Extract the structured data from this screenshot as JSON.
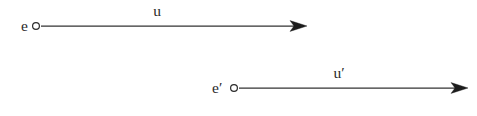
{
  "figure": {
    "type": "vector-diagram",
    "background_color": "#ffffff",
    "line_color": "#333333",
    "label_color": "#2a2a2a",
    "arrows": [
      {
        "id": "arrow-u",
        "origin_label": "e",
        "vector_label": "u",
        "origin_marker": "open-circle",
        "head_marker": "solid-triangle",
        "start_x": 41,
        "end_x": 307,
        "y": 26,
        "label_x": 157,
        "label_y": 16
      },
      {
        "id": "arrow-u-prime",
        "origin_label": "e′",
        "vector_label": "u′",
        "origin_marker": "open-circle",
        "head_marker": "solid-triangle",
        "start_x": 239,
        "end_x": 468,
        "y": 88,
        "label_x": 339,
        "label_y": 78
      }
    ],
    "node_labels": [
      {
        "text": "e",
        "x": 21,
        "y": 31
      },
      {
        "text": "e′",
        "x": 212,
        "y": 93
      }
    ],
    "vector_labels": [
      {
        "text": "u",
        "x": 157,
        "y": 16
      },
      {
        "text": "u′",
        "x": 339,
        "y": 78
      }
    ]
  }
}
